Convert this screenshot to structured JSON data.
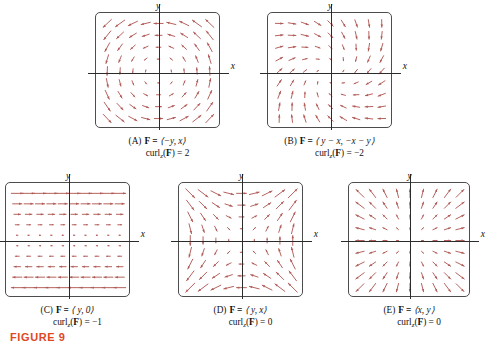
{
  "figure": {
    "number_label": "FIGURE 9",
    "number_color": "#e0481f",
    "arrow_color": "#b05a55",
    "axis_color": "#2b2b2b",
    "box_color": "#4d4d4d"
  },
  "axis_labels": {
    "x": "x",
    "y": "y"
  },
  "panels": [
    {
      "tag": "(A)",
      "field_label": "F =",
      "field_expr": "⟨−y, x⟩",
      "curl_label": "curl",
      "curl_sub": "z",
      "curl_expr": "(F) = 2",
      "curl_value": 2,
      "field": "rotation_ccw",
      "left": 95,
      "top": 12,
      "width": 125,
      "height": 116,
      "axis_y_frac": 0.52,
      "axis_x_frac": 0.5,
      "grid": 9,
      "scale": 0.62
    },
    {
      "tag": "(B)",
      "field_label": "F =",
      "field_expr": "⟨ y − x, −x − y⟩",
      "curl_label": "curl",
      "curl_sub": "z",
      "curl_expr": "(F) = −2",
      "curl_value": -2,
      "field": "spiral_cw",
      "left": 267,
      "top": 12,
      "width": 125,
      "height": 116,
      "axis_y_frac": 0.52,
      "axis_x_frac": 0.5,
      "grid": 9,
      "scale": 0.42
    },
    {
      "tag": "(C)",
      "field_label": "F =",
      "field_expr": "⟨ y, 0⟩",
      "curl_label": "curl",
      "curl_sub": "z",
      "curl_expr": "(F) = −1",
      "curl_value": -1,
      "field": "shear_y0",
      "left": 5,
      "top": 182,
      "width": 125,
      "height": 115,
      "axis_y_frac": 0.5,
      "axis_x_frac": 0.5,
      "grid": 10,
      "scale": 0.95
    },
    {
      "tag": "(D)",
      "field_label": "F =",
      "field_expr": "⟨ y, x⟩",
      "curl_label": "curl",
      "curl_sub": "z",
      "curl_expr": "(F) = 0",
      "curl_value": 0,
      "field": "saddle_yx",
      "left": 178,
      "top": 182,
      "width": 125,
      "height": 115,
      "axis_y_frac": 0.5,
      "axis_x_frac": 0.5,
      "grid": 9,
      "scale": 0.7
    },
    {
      "tag": "(E)",
      "field_label": "F =",
      "field_expr": "⟨x, y⟩",
      "curl_label": "curl",
      "curl_sub": "z",
      "curl_expr": "(F) = 0",
      "curl_value": 0,
      "field": "radial_xy",
      "left": 348,
      "top": 182,
      "width": 122,
      "height": 115,
      "axis_y_frac": 0.5,
      "axis_x_frac": 0.5,
      "grid": 9,
      "scale": 0.6
    }
  ]
}
